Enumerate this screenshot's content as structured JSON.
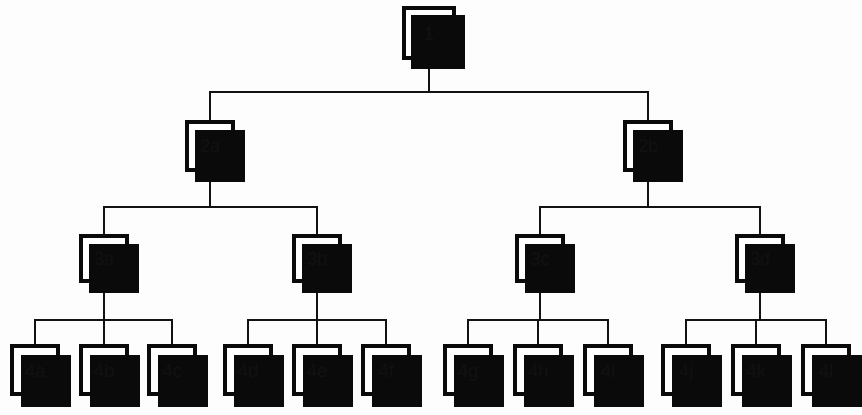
{
  "diagram": {
    "type": "tree",
    "background_color": "#fdfdfd",
    "node_fill_color": "#ffffff",
    "node_border_color": "#0a0a0a",
    "node_shadow_color": "#0a0a0a",
    "connector_color": "#121212",
    "levels": 4
  },
  "nodes": {
    "root": {
      "label": "1",
      "level": 1
    },
    "level2": [
      {
        "label": "2a",
        "level": 2
      },
      {
        "label": "2b",
        "level": 2
      }
    ],
    "level3": [
      {
        "label": "3a",
        "level": 3,
        "parent": "2a"
      },
      {
        "label": "3b",
        "level": 3,
        "parent": "2a"
      },
      {
        "label": "3c",
        "level": 3,
        "parent": "2b"
      },
      {
        "label": "3d",
        "level": 3,
        "parent": "2b"
      }
    ],
    "level4": [
      {
        "label": "4a",
        "level": 4,
        "parent": "3a"
      },
      {
        "label": "4b",
        "level": 4,
        "parent": "3a"
      },
      {
        "label": "4c",
        "level": 4,
        "parent": "3a"
      },
      {
        "label": "4d",
        "level": 4,
        "parent": "3b"
      },
      {
        "label": "4e",
        "level": 4,
        "parent": "3b"
      },
      {
        "label": "4f",
        "level": 4,
        "parent": "3b"
      },
      {
        "label": "4g",
        "level": 4,
        "parent": "3c"
      },
      {
        "label": "4h",
        "level": 4,
        "parent": "3c"
      },
      {
        "label": "4i",
        "level": 4,
        "parent": "3c"
      },
      {
        "label": "4j",
        "level": 4,
        "parent": "3d"
      },
      {
        "label": "4k",
        "level": 4,
        "parent": "3d"
      },
      {
        "label": "4l",
        "level": 4,
        "parent": "3d"
      }
    ]
  }
}
